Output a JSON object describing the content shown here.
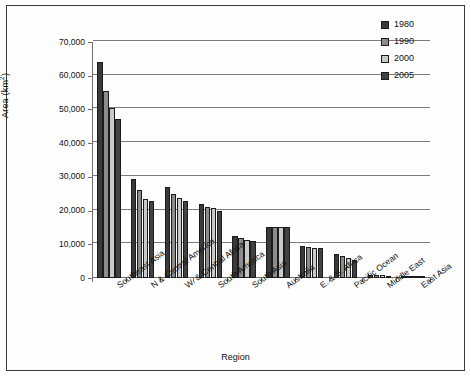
{
  "chart_data": {
    "type": "bar",
    "title": "",
    "xlabel": "Region",
    "ylabel": "Area (km2)",
    "ylabel_base": "Area (km",
    "ylabel_sup": "2",
    "ylabel_tail": ")",
    "ylim": [
      0,
      70000
    ],
    "ytick_step": 10000,
    "grid": true,
    "legend_position": "top-right",
    "categories": [
      "Southeast Asia",
      "N & Central America",
      "W. & Central Africa",
      "South America",
      "South Asia",
      "Australia",
      "E. & S. Africa",
      "Pacific Ocean",
      "Middle East",
      "East Asia"
    ],
    "ytick_labels": [
      "70,000",
      "60,000",
      "50,000",
      "40,000",
      "30,000",
      "20,000",
      "10,000",
      "0"
    ],
    "ytick_values": [
      70000,
      60000,
      50000,
      40000,
      30000,
      20000,
      10000,
      0
    ],
    "series": [
      {
        "name": "1980",
        "color": "#3a3a3a",
        "values": [
          64000,
          29500,
          27000,
          22000,
          12500,
          15000,
          9500,
          7000,
          900,
          700
        ]
      },
      {
        "name": "1990",
        "color": "#8c8c8c",
        "values": [
          55500,
          26200,
          25000,
          21200,
          11800,
          15000,
          9200,
          6400,
          800,
          650
        ]
      },
      {
        "name": "2000",
        "color": "#c9c9c9",
        "values": [
          50500,
          23500,
          23600,
          20800,
          11300,
          15000,
          9000,
          5800,
          750,
          600
        ]
      },
      {
        "name": "2005",
        "color": "#424242",
        "values": [
          47200,
          22800,
          22800,
          20000,
          11100,
          15000,
          8800,
          5300,
          700,
          550
        ]
      }
    ]
  }
}
